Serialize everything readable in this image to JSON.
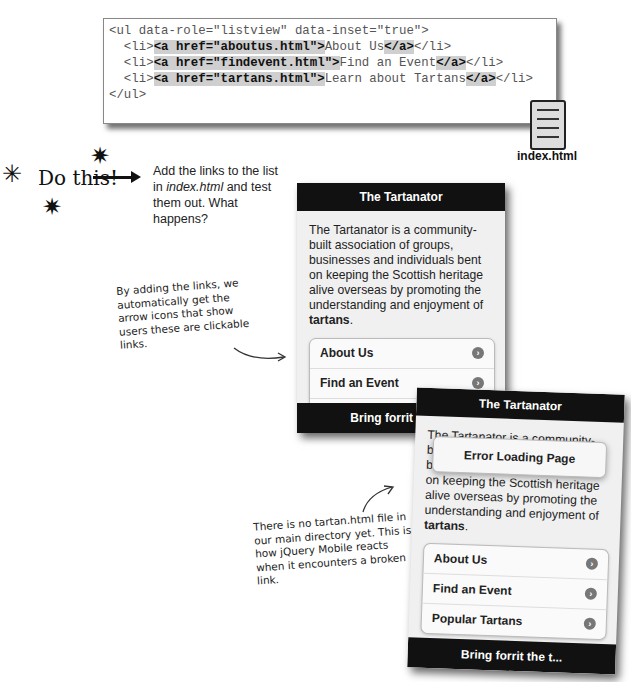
{
  "code": {
    "lines": [
      {
        "pre": "<ul data-role=\"listview\" data-inset=\"true\">",
        "hl1": "",
        "text": "",
        "hl2": "",
        "post": ""
      },
      {
        "pre": "  <li>",
        "hl1": "<a href=\"aboutus.html\">",
        "text": "About Us",
        "hl2": "</a>",
        "post": "</li>"
      },
      {
        "pre": "  <li>",
        "hl1": "<a href=\"findevent.html\">",
        "text": "Find an Event",
        "hl2": "</a>",
        "post": "</li>"
      },
      {
        "pre": "  <li>",
        "hl1": "<a href=\"tartans.html\">",
        "text": "Learn about Tartans",
        "hl2": "</a>",
        "post": "</li>"
      },
      {
        "pre": "</ul>",
        "hl1": "",
        "text": "",
        "hl2": "",
        "post": ""
      }
    ],
    "file_label": "index.html"
  },
  "exercise": {
    "do_this": "Do this!",
    "instruction_1": "Add the links to the list in ",
    "instruction_file": "index.html",
    "instruction_2": " and test them out. What happens?"
  },
  "notes": {
    "links_note": "By adding the links, we automatically get the arrow icons that show users these are clickable links.",
    "broken_note": "There is no tartan.html file in our main directory yet. This is how jQuery Mobile reacts when it encounters a broken link."
  },
  "phone1": {
    "header": "The Tartanator",
    "intro": "The Tartanator is a community-built association of groups, businesses and individuals bent on keeping the Scottish heritage alive overseas by promoting the understanding and enjoyment of ",
    "intro_bold": "tartans",
    "intro_end": ".",
    "items": [
      "About Us",
      "Find an Event",
      "Popular Tartans"
    ],
    "footer": "Bring forrit the t..."
  },
  "phone2": {
    "header": "The Tartanator",
    "error": "Error Loading Page",
    "intro": "The Tartanator is a community-built association of groups, businesses and individuals bent on keeping the Scottish heritage alive overseas by promoting the understanding and enjoyment of ",
    "intro_bold": "tartans",
    "intro_end": ".",
    "items": [
      "About Us",
      "Find an Event",
      "Popular Tartans"
    ],
    "footer": "Bring forrit the t..."
  }
}
